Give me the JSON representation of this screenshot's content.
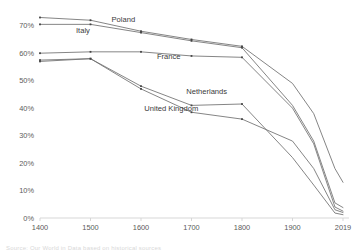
{
  "chart_data": {
    "type": "line",
    "title": "",
    "subtitle": "",
    "xlabel": "",
    "ylabel": "",
    "xlim": [
      1400,
      2019
    ],
    "ylim": [
      0,
      75
    ],
    "grid": false,
    "legend_position": "inline-direct-labels",
    "x_ticks": [
      "1400",
      "1500",
      "1600",
      "1700",
      "1800",
      "1900",
      "2019"
    ],
    "x_tick_values": [
      1400,
      1500,
      1600,
      1700,
      1800,
      1900,
      2019
    ],
    "y_ticks": [
      "0%",
      "10%",
      "20%",
      "30%",
      "40%",
      "50%",
      "60%",
      "70%"
    ],
    "y_tick_values": [
      0,
      10,
      20,
      30,
      40,
      50,
      60,
      70
    ],
    "series": [
      {
        "name": "Poland",
        "color": "#6f6f6f",
        "label_x": 1565,
        "label_y": 71.5,
        "x": [
          1400,
          1500,
          1600,
          1700,
          1800,
          1900,
          1950,
          2000,
          2019
        ],
        "values": [
          73.0,
          72.0,
          68.0,
          65.0,
          62.5,
          49.0,
          38.0,
          18.0,
          13.0
        ]
      },
      {
        "name": "Italy",
        "color": "#6f6f6f",
        "label_x": 1485,
        "label_y": 67.5,
        "x": [
          1400,
          1500,
          1600,
          1700,
          1800,
          1900,
          1950,
          2000,
          2019
        ],
        "values": [
          70.5,
          70.5,
          67.5,
          64.5,
          62.0,
          41.0,
          28.0,
          5.5,
          3.8
        ]
      },
      {
        "name": "France",
        "color": "#6f6f6f",
        "label_x": 1655,
        "label_y": 58.0,
        "x": [
          1400,
          1500,
          1600,
          1700,
          1800,
          1900,
          1950,
          2000,
          2019
        ],
        "values": [
          60.0,
          60.5,
          60.5,
          59.0,
          58.5,
          40.0,
          27.0,
          4.0,
          2.5
        ],
        "label_anchor": "middle"
      },
      {
        "name": "Netherlands",
        "color": "#6f6f6f",
        "label_x": 1730,
        "label_y": 45.0,
        "x": [
          1400,
          1500,
          1600,
          1700,
          1800,
          1900,
          1950,
          2000,
          2019
        ],
        "values": [
          57.0,
          58.0,
          47.0,
          38.5,
          36.0,
          28.0,
          18.0,
          3.0,
          2.0
        ]
      },
      {
        "name": "United Kingdom",
        "color": "#6f6f6f",
        "label_x": 1660,
        "label_y": 39.0,
        "x": [
          1400,
          1500,
          1600,
          1700,
          1800,
          1900,
          1950,
          2000,
          2019
        ],
        "values": [
          57.5,
          58.0,
          48.0,
          41.0,
          41.5,
          22.0,
          12.0,
          1.8,
          1.2
        ]
      }
    ]
  },
  "caption": {
    "text": "Source: Our World in Data based on historical sources"
  }
}
